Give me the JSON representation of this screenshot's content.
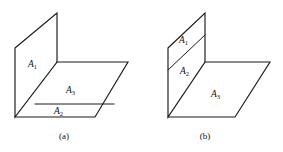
{
  "figure": {
    "background_color": "#ffffff",
    "line_color": "#1a1a1a",
    "panels": [
      {
        "id": "a",
        "caption": "(a)",
        "labels": [
          {
            "name": "A",
            "sub": "1",
            "role": "vertical-plane"
          },
          {
            "name": "A",
            "sub": "3",
            "role": "horizontal-plane"
          },
          {
            "name": "A",
            "sub": "2",
            "role": "front-strip"
          }
        ]
      },
      {
        "id": "b",
        "caption": "(b)",
        "labels": [
          {
            "name": "A",
            "sub": "1",
            "role": "vertical-plane-upper"
          },
          {
            "name": "A",
            "sub": "2",
            "role": "vertical-plane-lower"
          },
          {
            "name": "A",
            "sub": "3",
            "role": "horizontal-plane"
          }
        ]
      }
    ]
  },
  "panel_a": {
    "label_1": "A",
    "label_1_sub": "1",
    "label_3": "A",
    "label_3_sub": "3",
    "label_2": "A",
    "label_2_sub": "2",
    "caption": "(a)"
  },
  "panel_b": {
    "label_1": "A",
    "label_1_sub": "1",
    "label_2": "A",
    "label_2_sub": "2",
    "label_3": "A",
    "label_3_sub": "3",
    "caption": "(b)"
  }
}
